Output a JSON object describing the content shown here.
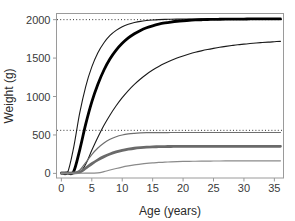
{
  "chart_data": {
    "type": "line",
    "title": "",
    "xlabel": "Age (years)",
    "ylabel": "Weight (g)",
    "xlim": [
      -0.8,
      36.5
    ],
    "ylim": [
      -60,
      2080
    ],
    "xticks": [
      0,
      5,
      10,
      15,
      20,
      25,
      30,
      35
    ],
    "xtick_labels": [
      "0",
      "5",
      "10",
      "15",
      "20",
      "25",
      "30",
      "35"
    ],
    "yticks": [
      0,
      500,
      1000,
      1500,
      2000
    ],
    "ytick_labels": [
      "0",
      "500",
      "1000",
      "1500",
      "2000"
    ],
    "grid": false,
    "legend": "none",
    "reference_lines": [
      {
        "name": "upper-asymptote-reference",
        "orientation": "horizontal",
        "y": 2000,
        "style": "dotted",
        "color": "#333333"
      },
      {
        "name": "lower-asymptote-reference",
        "orientation": "horizontal",
        "y": 560,
        "style": "dotted",
        "color": "#333333"
      }
    ],
    "x": [
      0,
      1,
      2,
      3,
      4,
      5,
      6,
      7,
      8,
      9,
      10,
      11,
      12,
      13,
      14,
      15,
      16,
      17,
      18,
      19,
      20,
      21,
      22,
      23,
      24,
      25,
      26,
      27,
      28,
      29,
      30,
      31,
      32,
      33,
      34,
      35,
      36
    ],
    "series": [
      {
        "name": "large-fast-thin",
        "color": "#1a1a1a",
        "width": 1.1,
        "asymptote": 2010,
        "onset_age": 1.0,
        "values": [
          5,
          8,
          330,
          780,
          1130,
          1385,
          1570,
          1700,
          1795,
          1860,
          1908,
          1940,
          1962,
          1978,
          1988,
          1995,
          2000,
          2003,
          2005,
          2007,
          2008,
          2009,
          2009,
          2010,
          2010,
          2010,
          2010,
          2010,
          2010,
          2010,
          2010,
          2010,
          2010,
          2010,
          2010,
          2010,
          2010
        ]
      },
      {
        "name": "large-medium-thick",
        "color": "#000000",
        "width": 2.8,
        "asymptote": 2010,
        "onset_age": 2.0,
        "values": [
          4,
          5,
          20,
          300,
          640,
          930,
          1160,
          1345,
          1490,
          1603,
          1692,
          1762,
          1817,
          1860,
          1894,
          1920,
          1941,
          1957,
          1969,
          1979,
          1986,
          1992,
          1996,
          1999,
          2002,
          2004,
          2005,
          2006,
          2007,
          2008,
          2008,
          2009,
          2009,
          2010,
          2010,
          2010,
          2010
        ]
      },
      {
        "name": "large-slow-thin",
        "color": "#1a1a1a",
        "width": 1.1,
        "asymptote": 1960,
        "onset_age": 3.4,
        "values": [
          3,
          4,
          6,
          12,
          120,
          300,
          470,
          625,
          760,
          880,
          985,
          1078,
          1158,
          1228,
          1290,
          1344,
          1391,
          1432,
          1468,
          1500,
          1528,
          1553,
          1575,
          1594,
          1611,
          1626,
          1640,
          1652,
          1663,
          1673,
          1681,
          1689,
          1696,
          1702,
          1708,
          1713,
          1718
        ]
      },
      {
        "name": "small-fast-thin",
        "color": "#6e6e6e",
        "width": 1.2,
        "asymptote": 532,
        "onset_age": 2.6,
        "values": [
          3,
          4,
          8,
          40,
          140,
          245,
          330,
          395,
          443,
          477,
          499,
          513,
          521,
          526,
          529,
          530,
          531,
          531,
          532,
          532,
          532,
          532,
          532,
          532,
          532,
          532,
          532,
          532,
          532,
          532,
          532,
          532,
          532,
          532,
          532,
          532,
          532
        ]
      },
      {
        "name": "small-medium-thick",
        "color": "#6a6a6a",
        "width": 2.8,
        "asymptote": 352,
        "onset_age": 3.2,
        "values": [
          2,
          3,
          5,
          14,
          68,
          125,
          176,
          218,
          252,
          279,
          300,
          315,
          327,
          335,
          341,
          345,
          347,
          349,
          350,
          351,
          351,
          352,
          352,
          352,
          352,
          352,
          352,
          352,
          352,
          352,
          352,
          352,
          352,
          352,
          352,
          352,
          352
        ]
      },
      {
        "name": "small-slow-thin",
        "color": "#8a8a8a",
        "width": 1.2,
        "asymptote": 163,
        "onset_age": 6.3,
        "values": [
          1,
          1,
          2,
          2,
          3,
          4,
          6,
          22,
          44,
          64,
          82,
          97,
          110,
          120,
          129,
          136,
          142,
          146,
          150,
          153,
          155,
          157,
          158,
          159,
          160,
          161,
          161,
          162,
          162,
          162,
          163,
          163,
          163,
          163,
          163,
          163,
          163
        ]
      }
    ]
  }
}
